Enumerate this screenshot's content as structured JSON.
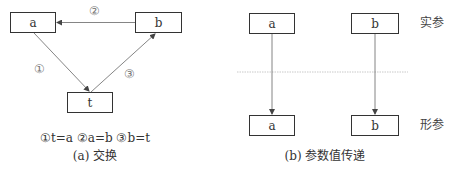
{
  "panel_a": {
    "boxes": {
      "a": "a",
      "b": "b",
      "t": "t"
    },
    "step_labels": {
      "step1": "①",
      "step2": "②",
      "step3": "③"
    },
    "steps_caption": "①t=a ②a=b ③b=t",
    "caption": "(a) 交换"
  },
  "panel_b": {
    "top_boxes": [
      "a",
      "b"
    ],
    "bottom_boxes": [
      "a",
      "b"
    ],
    "top_row_label": "实参",
    "bottom_row_label": "形参",
    "caption": "(b) 参数值传递"
  },
  "colors": {
    "line": "#555555",
    "box_border": "#333333",
    "divider": "#bbbbbb"
  }
}
